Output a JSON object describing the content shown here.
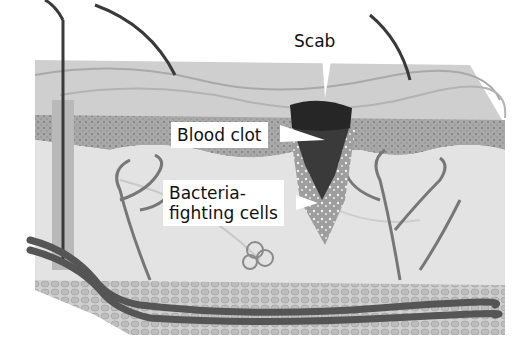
{
  "diagram": {
    "style": "grayscale illustration",
    "colors": {
      "background": "#ffffff",
      "skin_surface": "#c9c9c9",
      "epidermis": "#9a9a9a",
      "dermis": "#e2e2e2",
      "scab": "#2a2a2a",
      "clot": "#3a3a3a",
      "vessel": "#6a6a6a",
      "fat": "#bdbdbd"
    },
    "labels": [
      {
        "id": "scab",
        "text": "Scab"
      },
      {
        "id": "blood-clot",
        "text": "Blood clot"
      },
      {
        "id": "bacteria-fighting-cells",
        "lines": [
          "Bacteria-",
          "fighting cells"
        ]
      }
    ]
  }
}
